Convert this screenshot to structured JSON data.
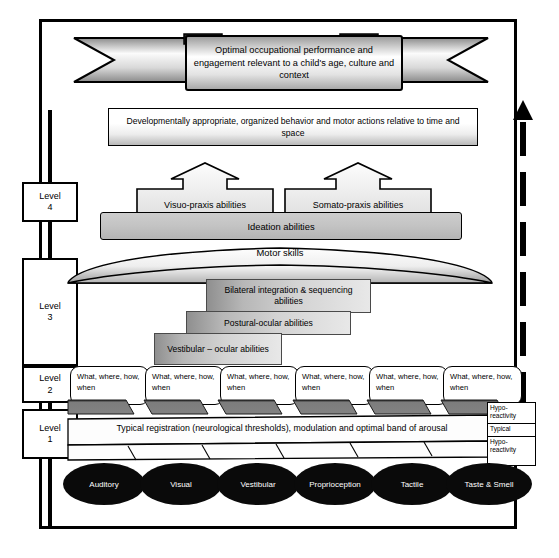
{
  "diagram": {
    "title_banner": "Optimal occupational performance and engagement relevant to a child's age, culture and context",
    "dev_bar": "Developmentally appropriate, organized behavior and motor actions relative to time and space",
    "ideation": "Ideation abilities",
    "motor_skills": "Motor skills",
    "band": "Typical registration (neurological thresholds), modulation and optimal band of arousal"
  },
  "levels": [
    {
      "name": "level-4",
      "line1": "Level",
      "line2": "4"
    },
    {
      "name": "level-3",
      "line1": "Level",
      "line2": "3"
    },
    {
      "name": "level-2",
      "line1": "Level",
      "line2": "2"
    },
    {
      "name": "level-1",
      "line1": "Level",
      "line2": "1"
    }
  ],
  "praxis": [
    {
      "name": "visuo-praxis",
      "label": "Visuo-praxis abilities"
    },
    {
      "name": "somato-praxis",
      "label": "Somato-praxis abilities"
    }
  ],
  "staircase": [
    {
      "name": "bilateral-integration",
      "label": "Bilateral integration & sequencing abilities"
    },
    {
      "name": "postural-ocular",
      "label": "Postural-ocular abilities"
    },
    {
      "name": "vestibular-ocular",
      "label": "Vestibular – ocular abilities"
    }
  ],
  "sensory_questions": [
    "What, where, how, when",
    "What, where, how, when",
    "What, where, how, when",
    "What, where, how, when",
    "What, where, how, when",
    "What, where, how, when"
  ],
  "senses": [
    {
      "name": "auditory",
      "label": "Auditory"
    },
    {
      "name": "visual",
      "label": "Visual"
    },
    {
      "name": "vestibular",
      "label": "Vestibular"
    },
    {
      "name": "proprioception",
      "label": "Proprioception"
    },
    {
      "name": "tactile",
      "label": "Tactile"
    },
    {
      "name": "taste-and-smell",
      "label": "Taste & Smell"
    }
  ],
  "reactivity_legend": [
    {
      "name": "hypo-reactivity-top",
      "label": "Hypo-reactivity"
    },
    {
      "name": "typical",
      "label": "Typical"
    },
    {
      "name": "hypo-reactivity-bottom",
      "label": "Hypo-reactivity"
    }
  ],
  "colors": {
    "stroke": "#000000",
    "oval_fill": "#0a0a0a",
    "ideation_fill": "#c3c3c3",
    "slant_fill": "#6e6e6e"
  }
}
